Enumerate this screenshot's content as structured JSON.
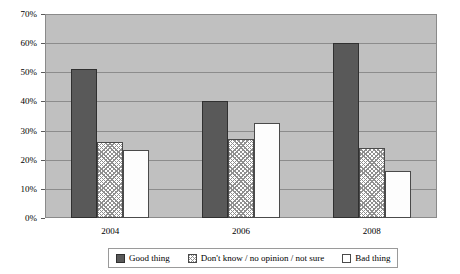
{
  "chart_data": {
    "type": "bar",
    "title": "",
    "xlabel": "",
    "ylabel": "",
    "categories": [
      "2004",
      "2006",
      "2008"
    ],
    "series": [
      {
        "name": "Good thing",
        "values": [
          51,
          40,
          60
        ],
        "color": "#595959",
        "fill": "solid"
      },
      {
        "name": "Don't know / no opinion / not sure",
        "values": [
          26,
          27,
          24
        ],
        "color": "#ffffff",
        "fill": "cross-hatch"
      },
      {
        "name": "Bad thing",
        "values": [
          23.5,
          32.5,
          16
        ],
        "color": "#ffffff",
        "fill": "solid-white"
      }
    ],
    "ylim": [
      0,
      70
    ],
    "ytick_step": 10,
    "ytick_labels": [
      "0%",
      "10%",
      "20%",
      "30%",
      "40%",
      "50%",
      "60%",
      "70%"
    ],
    "ytick_values": [
      0,
      10,
      20,
      30,
      40,
      50,
      60,
      70
    ],
    "grid": true,
    "grid_axis": "y",
    "legend_position": "bottom",
    "plot_background": "#c0c0c0",
    "gridline_color": "#8c8c8c"
  },
  "legend": {
    "items": [
      {
        "label": "Good thing"
      },
      {
        "label": "Don't know / no opinion / not sure"
      },
      {
        "label": "Bad thing"
      }
    ]
  },
  "top_caption": ""
}
